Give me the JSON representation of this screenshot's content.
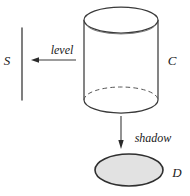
{
  "figure": {
    "background_color": "#ffffff",
    "stroke_color": "#3a3a3a",
    "text_color": "#1a1a1a",
    "shadow_fill_color": "#e2e2e2",
    "labels": {
      "level_line": "S",
      "cylinder": "C",
      "shadow_disk": "D",
      "level_arrow": "level",
      "shadow_arrow": "shadow"
    },
    "geometry": {
      "vertical_line": {
        "x": 22,
        "y_top": 28,
        "y_bottom": 100
      },
      "level_arrow": {
        "x_start": 76,
        "x_end": 32,
        "y": 60,
        "direction": "left"
      },
      "cylinder": {
        "center_x": 121,
        "radius_x": 37,
        "radius_y": 13,
        "top_center_y": 20,
        "bottom_center_y": 100,
        "bottom_back_arc": "dashed",
        "bottom_front_arc": "solid"
      },
      "shadow_arrow": {
        "x": 121,
        "y_start": 116,
        "y_end": 148,
        "direction": "down"
      },
      "shadow_ellipse": {
        "center_x": 129,
        "center_y": 170,
        "radius_x": 34,
        "radius_y": 16
      }
    }
  }
}
